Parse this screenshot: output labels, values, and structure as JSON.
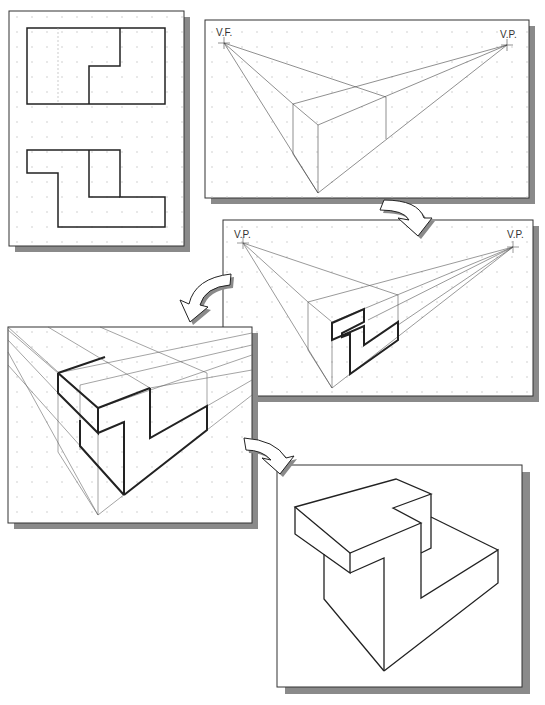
{
  "diagram": {
    "type": "perspective-drawing-steps",
    "panels": [
      {
        "id": "orthographic-views",
        "description": "Top and front views of Z-shaped block"
      },
      {
        "id": "step-1-box",
        "vp_left": "V.F.",
        "vp_right": "V.P."
      },
      {
        "id": "step-2-profile",
        "vp_left": "V.P.",
        "vp_right": "V.P."
      },
      {
        "id": "step-3-extrude"
      },
      {
        "id": "step-4-final"
      }
    ],
    "colors": {
      "line": "#222222",
      "construction": "#888888",
      "shadow": "#8a8a8a",
      "dot": "#c8c8c8",
      "paper": "#ffffff"
    }
  }
}
